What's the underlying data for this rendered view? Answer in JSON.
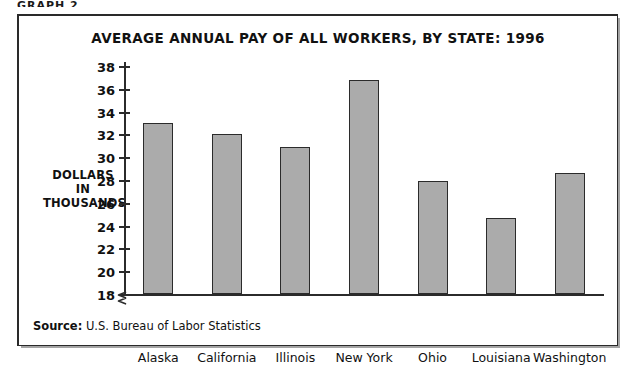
{
  "top_caption": "GRAPH 2",
  "chart_data": {
    "type": "bar",
    "title": "AVERAGE ANNUAL PAY OF ALL WORKERS, BY STATE: 1996",
    "xlabel": "",
    "ylabel": "DOLLARS IN THOUSANDS",
    "ylabel_lines": [
      "DOLLARS",
      "IN",
      "THOUSANDS"
    ],
    "categories": [
      "Alaska",
      "California",
      "Illinois",
      "New York",
      "Ohio",
      "Louisiana",
      "Washington"
    ],
    "values": [
      33.0,
      32.0,
      30.9,
      36.8,
      27.9,
      24.7,
      28.6
    ],
    "ylim": [
      18,
      38
    ],
    "ytick_step": 2,
    "yticks": [
      18,
      20,
      22,
      24,
      26,
      28,
      30,
      32,
      34,
      36,
      38
    ],
    "ytick_labels": [
      "18",
      "20",
      "22",
      "24",
      "26",
      "28",
      "30",
      "32",
      "34",
      "36",
      "38"
    ],
    "axis_break": true,
    "grid": false,
    "legend": null,
    "bar_fill_color": "#ababab",
    "bar_border_color": "#2b2b2b",
    "units": "thousands of dollars"
  },
  "source": {
    "label": "Source:",
    "text": "U.S. Bureau of Labor Statistics"
  }
}
